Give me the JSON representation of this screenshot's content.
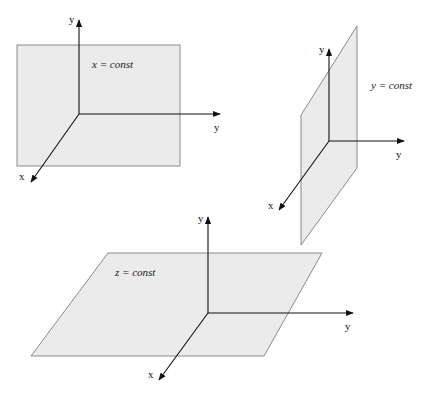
{
  "diagrams": [
    {
      "id": "x-const",
      "plane_label": "x = const",
      "axis_labels": {
        "vertical": "y",
        "horizontal": "y",
        "diagonal": "x"
      }
    },
    {
      "id": "y-const",
      "plane_label": "y = const",
      "axis_labels": {
        "vertical": "y",
        "horizontal": "y",
        "diagonal": "x"
      }
    },
    {
      "id": "z-const",
      "plane_label": "z = const",
      "axis_labels": {
        "vertical": "y",
        "horizontal": "y",
        "diagonal": "x"
      }
    }
  ],
  "colors": {
    "plane_fill": "#ebebeb",
    "plane_stroke": "#8a8a8a",
    "axis": "#111111"
  }
}
